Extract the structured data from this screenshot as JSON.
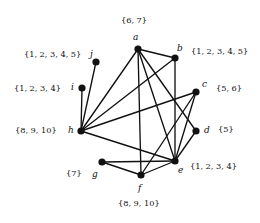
{
  "figure": {
    "type": "undirected-graph-with-set-labels",
    "background_color": "#ffffff",
    "vertex_color": "#111111",
    "edge_color": "#111111",
    "width": 260,
    "height": 223
  },
  "vertices": [
    {
      "id": "a",
      "name_label": "a",
      "set_label": "{6, 7}",
      "x": 138,
      "y": 49,
      "name_x": 133,
      "name_y": 33,
      "set_x": 121,
      "set_y": 16,
      "set_align": "left"
    },
    {
      "id": "b",
      "name_label": "b",
      "set_label": "{1, 2, 3, 4, 5}",
      "x": 175,
      "y": 58,
      "name_x": 177,
      "name_y": 44,
      "set_x": 191,
      "set_y": 47,
      "set_align": "left"
    },
    {
      "id": "c",
      "name_label": "c",
      "set_label": "{5, 6}",
      "x": 196,
      "y": 92,
      "name_x": 202,
      "name_y": 80,
      "set_x": 216,
      "set_y": 84,
      "set_align": "left"
    },
    {
      "id": "d",
      "name_label": "d",
      "set_label": "{5}",
      "x": 196,
      "y": 131,
      "name_x": 204,
      "name_y": 126,
      "set_x": 218,
      "set_y": 125,
      "set_align": "left"
    },
    {
      "id": "e",
      "name_label": "e",
      "set_label": "{1, 2, 3, 4}",
      "x": 175,
      "y": 161,
      "name_x": 178,
      "name_y": 166,
      "set_x": 190,
      "set_y": 162,
      "set_align": "left"
    },
    {
      "id": "f",
      "name_label": "f",
      "set_label": "{8, 9, 10}",
      "x": 141,
      "y": 175,
      "name_x": 138,
      "name_y": 184,
      "set_x": 118,
      "set_y": 199,
      "set_align": "left"
    },
    {
      "id": "g",
      "name_label": "g",
      "set_label": "{7}",
      "x": 102,
      "y": 162,
      "name_x": 92,
      "name_y": 170,
      "set_x": 66,
      "set_y": 169,
      "set_align": "left"
    },
    {
      "id": "h",
      "name_label": "h",
      "set_label": "{8, 9, 10}",
      "x": 81,
      "y": 131,
      "name_x": 68,
      "name_y": 126,
      "set_x": 15,
      "set_y": 126,
      "set_align": "left"
    },
    {
      "id": "i",
      "name_label": "i",
      "set_label": "{1, 2, 3, 4}",
      "x": 82,
      "y": 88,
      "name_x": 71,
      "name_y": 83,
      "set_x": 14,
      "set_y": 84,
      "set_align": "left"
    },
    {
      "id": "j",
      "name_label": "j",
      "set_label": "{1, 2, 3, 4, 5}",
      "x": 96,
      "y": 62,
      "name_x": 90,
      "name_y": 50,
      "set_x": 24,
      "set_y": 50,
      "set_align": "left"
    }
  ],
  "edges": [
    {
      "from": "a",
      "to": "b"
    },
    {
      "from": "a",
      "to": "d"
    },
    {
      "from": "a",
      "to": "e"
    },
    {
      "from": "a",
      "to": "f"
    },
    {
      "from": "a",
      "to": "h"
    },
    {
      "from": "b",
      "to": "e"
    },
    {
      "from": "b",
      "to": "h"
    },
    {
      "from": "c",
      "to": "e"
    },
    {
      "from": "c",
      "to": "f"
    },
    {
      "from": "c",
      "to": "h"
    },
    {
      "from": "d",
      "to": "e"
    },
    {
      "from": "e",
      "to": "f"
    },
    {
      "from": "e",
      "to": "g"
    },
    {
      "from": "e",
      "to": "h"
    },
    {
      "from": "f",
      "to": "g"
    },
    {
      "from": "h",
      "to": "i"
    },
    {
      "from": "h",
      "to": "j"
    }
  ]
}
